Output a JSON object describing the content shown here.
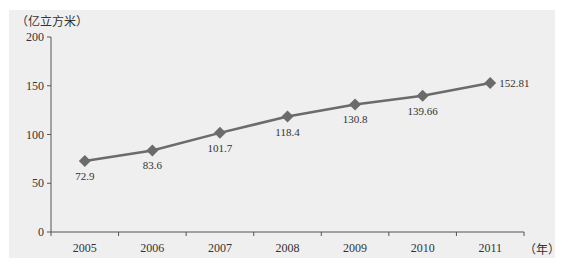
{
  "chart_data": {
    "type": "line",
    "title": "",
    "xlabel": "（年）",
    "ylabel": "（亿立方米）",
    "categories": [
      "2005",
      "2006",
      "2007",
      "2008",
      "2009",
      "2010",
      "2011"
    ],
    "series": [
      {
        "name": "",
        "values": [
          72.9,
          83.6,
          101.7,
          118.4,
          130.8,
          139.66,
          152.81
        ],
        "labels": [
          "72.9",
          "83.6",
          "101.7",
          "118.4",
          "130.8",
          "139.66",
          "152.81"
        ],
        "marker": "diamond",
        "color": "#6b6b6b"
      }
    ],
    "ylim": [
      0,
      200
    ],
    "yticks": [
      0,
      50,
      100,
      150,
      200
    ],
    "grid": false,
    "legend": "none"
  },
  "colors": {
    "panel": "#efefef",
    "line": "#6b6b6b",
    "axis": "#555555",
    "text": "#333333"
  }
}
